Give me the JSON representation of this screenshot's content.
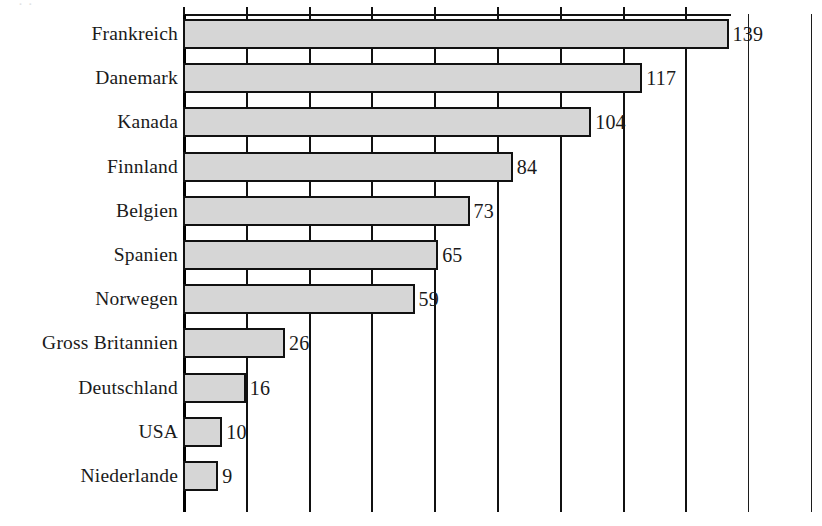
{
  "chart_data": {
    "type": "bar",
    "orientation": "horizontal",
    "title": "",
    "xlabel": "",
    "ylabel": "",
    "categories": [
      "Frankreich",
      "Danemark",
      "Kanada",
      "Finnland",
      "Belgien",
      "Spanien",
      "Norwegen",
      "Gross Britannien",
      "Deutschland",
      "USA",
      "Niederlande"
    ],
    "values": [
      139,
      117,
      104,
      84,
      73,
      65,
      59,
      26,
      16,
      10,
      9
    ],
    "value_labels": [
      "139",
      "117",
      "104",
      "84",
      "73",
      "65",
      "59",
      "26",
      "16",
      "10",
      "9"
    ],
    "xlim": [
      0,
      160
    ],
    "gridline_values": [
      0,
      16,
      32,
      48,
      64,
      80,
      96,
      112,
      128,
      144,
      160
    ],
    "grid": true,
    "tick_labels_visible": false,
    "legend": null,
    "bar_fill_color": "#d6d6d6",
    "bar_edge_color": "#111111",
    "axis_color": "#111111",
    "background_color": "#ffffff"
  },
  "axis": {
    "top_tick_count": 9
  },
  "title_remnant": {
    "text": "·                            ·"
  }
}
